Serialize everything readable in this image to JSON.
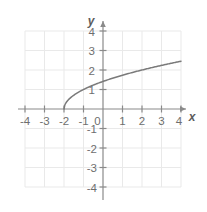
{
  "figure": {
    "kind": "cartesian-coordinate-plane",
    "axis_labels": {
      "x": "x",
      "y": "y"
    },
    "origin_label": "0",
    "colors": {
      "grid": "#e9e9e9",
      "axis": "#8a8a8a",
      "curve": "#7a7a7a",
      "label": "#6e6e6e",
      "background": "#ffffff"
    },
    "geometry": {
      "origin_px": [
        103,
        109
      ],
      "unit_px": 19.5,
      "grid_x_px": [
        25,
        181
      ],
      "grid_y_px": [
        31,
        187
      ]
    }
  },
  "chart_data": {
    "type": "line",
    "title": "",
    "xlabel": "x",
    "ylabel": "y",
    "xlim": [
      -4,
      4
    ],
    "ylim": [
      -4,
      4
    ],
    "grid": true,
    "legend": null,
    "x_ticks": [
      -4,
      -3,
      -2,
      -1,
      0,
      1,
      2,
      3,
      4
    ],
    "y_ticks": [
      -4,
      -3,
      -2,
      -1,
      1,
      2,
      3,
      4
    ],
    "x_tick_labels": [
      "-4",
      "-3",
      "-2",
      "-1",
      "0",
      "1",
      "2",
      "3",
      "4"
    ],
    "y_tick_labels": [
      "-4",
      "-3",
      "-2",
      "-1",
      "1",
      "2",
      "3",
      "4"
    ],
    "series": [
      {
        "name": "y = sqrt(x + 2)",
        "style": "solid",
        "color": "#7a7a7a",
        "domain": [
          -2,
          4
        ],
        "endpoint_open": false,
        "x": [
          -2,
          -1.9,
          -1.8,
          -1.7,
          -1.6,
          -1.5,
          -1.4,
          -1.2,
          -1,
          -0.8,
          -0.5,
          -0.25,
          0,
          0.5,
          1,
          1.5,
          2,
          2.5,
          3,
          3.5,
          4
        ],
        "y": [
          0,
          0.32,
          0.45,
          0.55,
          0.63,
          0.71,
          0.77,
          0.89,
          1,
          1.1,
          1.22,
          1.32,
          1.41,
          1.58,
          1.73,
          1.87,
          2,
          2.12,
          2.24,
          2.35,
          2.45
        ]
      }
    ],
    "annotations": []
  }
}
